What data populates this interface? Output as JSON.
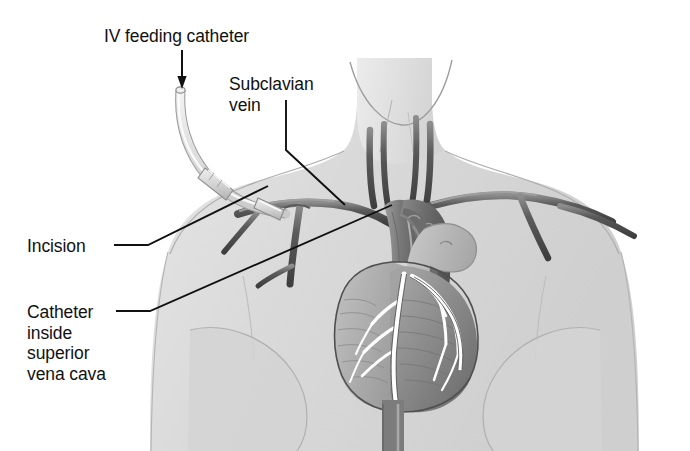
{
  "figure": {
    "type": "medical-illustration",
    "style": "grayscale line and tone drawing of human torso, neck and heart",
    "background_color": "#ffffff",
    "width": 690,
    "height": 451
  },
  "labels": {
    "iv_feeding_catheter": "IV feeding catheter",
    "subclavian_vein": "Subclavian\nvein",
    "incision": "Incision",
    "catheter_svc": "Catheter\ninside\nsuperior\nvena cava"
  },
  "annotations": {
    "arrow": {
      "name": "arrow-to-catheter-tip",
      "from": [
        182,
        50
      ],
      "to": [
        182,
        88
      ],
      "direction": "down"
    },
    "leaders": [
      {
        "name": "leader-subclavian-vein",
        "points": [
          [
            286,
            100
          ],
          [
            286,
            150
          ],
          [
            345,
            205
          ]
        ]
      },
      {
        "name": "leader-incision",
        "points": [
          [
            114,
            245
          ],
          [
            148,
            245
          ],
          [
            268,
            186
          ]
        ]
      },
      {
        "name": "leader-catheter-svc",
        "points": [
          [
            116,
            311
          ],
          [
            150,
            311
          ],
          [
            392,
            205
          ]
        ]
      }
    ]
  },
  "anatomy": {
    "parts": [
      {
        "name": "neck",
        "tone": "#e2e2e2"
      },
      {
        "name": "torso",
        "tone": "#dcdcdc"
      },
      {
        "name": "left-shoulder",
        "tone": "#dcdcdc"
      },
      {
        "name": "right-shoulder",
        "tone": "#dcdcdc"
      },
      {
        "name": "left-breast",
        "tone": "#d6d6d6"
      },
      {
        "name": "right-breast",
        "tone": "#d6d6d6"
      },
      {
        "name": "heart",
        "tone": "#9a9a9a"
      },
      {
        "name": "left-ventricle",
        "tone": "#8f8f8f"
      },
      {
        "name": "right-ventricle",
        "tone": "#a6a6a6"
      },
      {
        "name": "aortic-arch",
        "tone": "#6e6e6e"
      },
      {
        "name": "pulmonary-artery",
        "tone": "#b4b4b4"
      },
      {
        "name": "superior-vena-cava",
        "tone": "#8a8a8a"
      },
      {
        "name": "inferior-vena-cava",
        "tone": "#7e7e7e"
      },
      {
        "name": "coronary-arteries",
        "tone": "#ffffff"
      },
      {
        "name": "left-subclavian-vein",
        "tone": "#5e5e5e"
      },
      {
        "name": "right-subclavian-vein",
        "tone": "#5e5e5e"
      },
      {
        "name": "left-jugular-vein",
        "tone": "#4f4f4f"
      },
      {
        "name": "right-jugular-vein",
        "tone": "#4f4f4f"
      },
      {
        "name": "left-carotid-artery",
        "tone": "#4f4f4f"
      },
      {
        "name": "right-carotid-artery",
        "tone": "#4f4f4f"
      },
      {
        "name": "catheter-tube",
        "tone": "#e8e8e8"
      },
      {
        "name": "catheter-hub",
        "tone": "#d0d0d0"
      }
    ]
  },
  "colors": {
    "ink": "#111111",
    "vessel_dark": "#5a5a5a",
    "vessel_mid": "#8a8a8a",
    "skin_tone": "#dcdcdc",
    "heart_tone": "#9a9a9a",
    "catheter_tone": "#e8e8e8",
    "background": "#ffffff"
  }
}
